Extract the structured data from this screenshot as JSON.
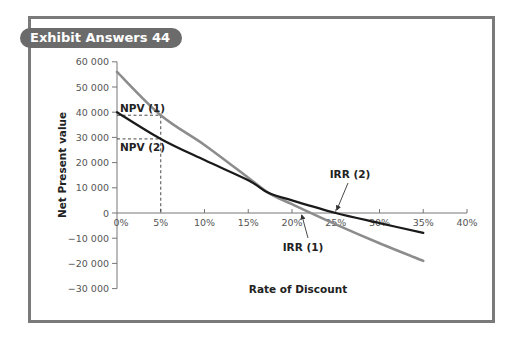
{
  "exhibit": {
    "title": "Exhibit Answers 44"
  },
  "chart_data": {
    "type": "line",
    "title": "Exhibit Answers 44",
    "xlabel": "Rate of Discount",
    "ylabel": "Net Present value",
    "xlim": [
      0,
      40
    ],
    "ylim": [
      -30000,
      60000
    ],
    "grid": false,
    "x_ticks": [
      "0%",
      "5%",
      "10%",
      "15%",
      "20%",
      "25%",
      "30%",
      "35%",
      "40%"
    ],
    "y_ticks": [
      "60 000",
      "50 000",
      "40 000",
      "30 000",
      "20 000",
      "10 000",
      "0",
      "−10 000",
      "−20 000",
      "−30 000"
    ],
    "x": [
      0,
      5,
      10,
      15,
      17.3,
      20,
      25,
      30,
      35
    ],
    "series": [
      {
        "name": "Project 1",
        "color": "#8c8c8c",
        "values": [
          56000,
          38800,
          27000,
          14000,
          8000,
          3500,
          -4500,
          -12000,
          -19000
        ]
      },
      {
        "name": "Project 2",
        "color": "#1a1a1a",
        "values": [
          40000,
          29400,
          21000,
          13000,
          8000,
          5000,
          0,
          -4000,
          -7900
        ]
      }
    ],
    "annotations": [
      {
        "text": "NPV (1)",
        "x": 5,
        "y": 38800
      },
      {
        "text": "NPV (2)",
        "x": 5,
        "y": 29400
      },
      {
        "text": "IRR (1)",
        "x": 21,
        "y": 0
      },
      {
        "text": "IRR (2)",
        "x": 25,
        "y": 0
      }
    ]
  }
}
